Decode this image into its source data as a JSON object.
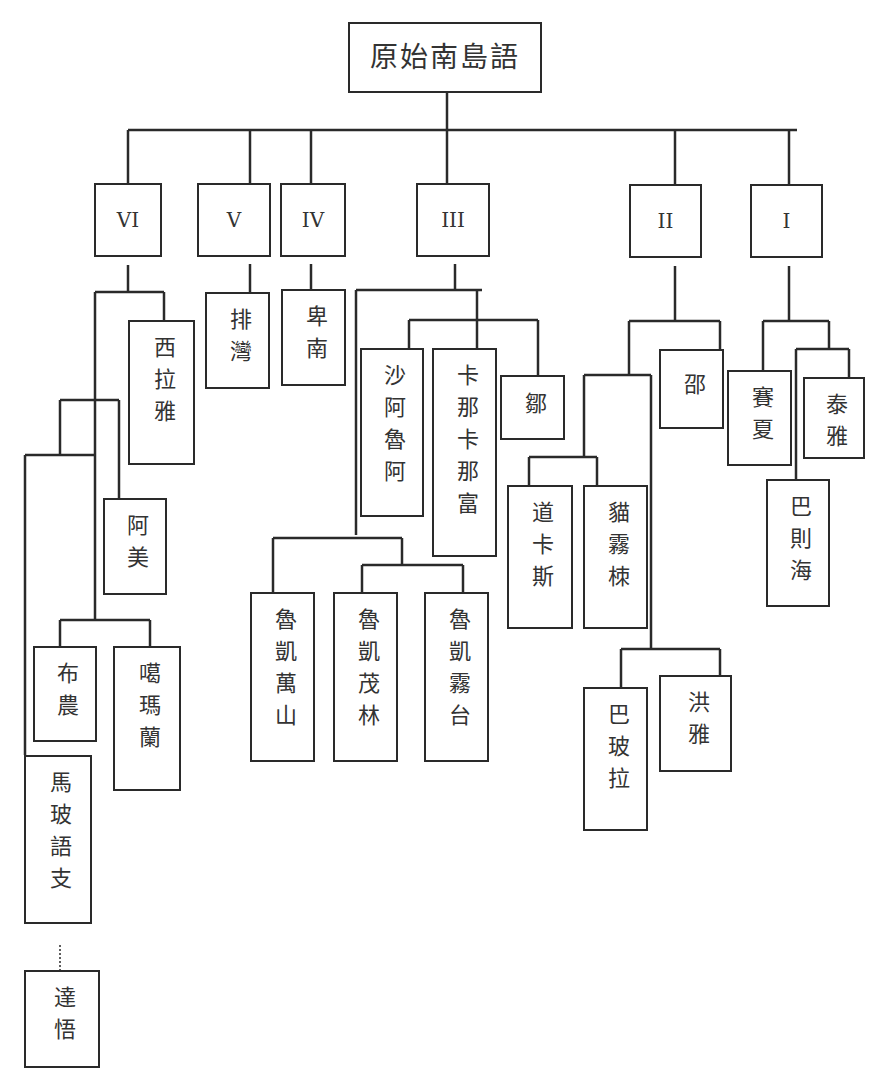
{
  "diagram": {
    "root": "原始南島語",
    "branches": {
      "VI": "VI",
      "V": "V",
      "IV": "IV",
      "III": "III",
      "II": "II",
      "I": "I"
    },
    "languages": {
      "siraya": "西拉雅",
      "paiwan": "排灣",
      "puyuma": "卑南",
      "amis": "阿美",
      "bunun": "布農",
      "kavalan": "噶瑪蘭",
      "malayo_polynesian": "馬玻語支",
      "yami": "達悟",
      "saaroa": "沙阿魯阿",
      "kanakanavu": "卡那卡那富",
      "tsou": "鄒",
      "rukai_wanshan": "魯凱萬山",
      "rukai_maolin": "魯凱茂林",
      "rukai_wutai": "魯凱霧台",
      "thao": "邵",
      "taokas": "道卡斯",
      "babuza": "貓霧栜",
      "papora": "巴玻拉",
      "hoanya": "洪雅",
      "saisiyat": "賽夏",
      "atayal": "泰雅",
      "pazeh": "巴則海"
    },
    "line_color": "#2a2a2a"
  }
}
